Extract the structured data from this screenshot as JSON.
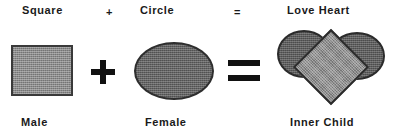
{
  "diagram": {
    "title_row": {
      "term_left": "Square",
      "operator_plus": "+",
      "term_middle": "Circle",
      "operator_equals": "=",
      "term_right": "Love Heart"
    },
    "caption_row": {
      "caption_left": "Male",
      "caption_middle": "Female",
      "caption_right": "Inner Child"
    },
    "operators": {
      "plus_glyph": "plus-sign",
      "equals_glyph": "equals-sign"
    },
    "shapes": {
      "square_name": "square-shape",
      "ellipse_name": "circle-shape",
      "heart_name": "heart-shape",
      "heart_parts": {
        "left_lobe": "heart-left-lobe",
        "right_lobe": "heart-right-lobe",
        "center_diamond": "heart-center-diamond"
      }
    },
    "colors": {
      "background": "#ffffff",
      "text": "#1a1a1a",
      "operator": "#111111",
      "square_fill": "#8a8a8a",
      "square_border": "#3a3a3a",
      "ellipse_fill": "#636363",
      "ellipse_border": "#2e2e2e",
      "heart_lobe_fill": "#5c5c5c",
      "heart_diamond_fill": "#8d8d8d",
      "heart_border": "#2b2b2b"
    }
  }
}
